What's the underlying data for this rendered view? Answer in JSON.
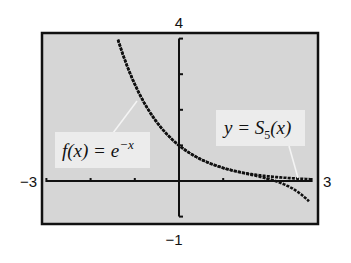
{
  "chart_data": {
    "type": "line",
    "title": "",
    "xlabel": "",
    "ylabel": "",
    "xlim": [
      -3,
      3
    ],
    "ylim": [
      -1,
      4
    ],
    "x_ticks": [
      -3,
      -2,
      -1,
      0,
      1,
      2,
      3
    ],
    "y_ticks": [
      -1,
      0,
      1,
      2,
      3,
      4
    ],
    "window_labels": {
      "xmin": "−3",
      "xmax": "3",
      "ymin": "−1",
      "ymax": "4"
    },
    "grid": false,
    "series": [
      {
        "name": "f(x) = e^(-x)",
        "formula": "e^(-x)",
        "x": [
          -1.4,
          -1.0,
          -0.5,
          0,
          0.5,
          1.0,
          1.5,
          2.0,
          2.5,
          3.0
        ],
        "values": [
          4.0,
          2.72,
          1.65,
          1.0,
          0.61,
          0.37,
          0.22,
          0.14,
          0.08,
          0.05
        ]
      },
      {
        "name": "y = S5(x)",
        "formula": "1 - x + x^2/2 - x^3/6 + x^4/24 - x^5/120",
        "x": [
          -1.4,
          -1.0,
          -0.5,
          0,
          0.5,
          1.0,
          1.5,
          2.0,
          2.5,
          2.95
        ],
        "values": [
          4.0,
          2.72,
          1.65,
          1.0,
          0.61,
          0.37,
          0.22,
          0.07,
          -0.19,
          -0.6
        ]
      }
    ],
    "annotations": [
      {
        "text": "f(x) = e^{-x}",
        "points_to": "exponential curve near x=-1"
      },
      {
        "text": "y = S_5(x)",
        "points_to": "polynomial curve near x=2.7"
      }
    ]
  },
  "labels": {
    "xmin": "−3",
    "xmax": "3",
    "ymin": "−1",
    "ymax": "4",
    "f_label_main": "f(x) = e",
    "f_label_sup": "−x",
    "s_label_y": "y = S",
    "s_label_sub": "5",
    "s_label_arg": "(x)"
  },
  "colors": {
    "page_bg": "#ffffff",
    "plot_bg": "#d6d6d6",
    "label_bg": "#ececec",
    "ink": "#111111",
    "leader": "#f4f4f4"
  }
}
